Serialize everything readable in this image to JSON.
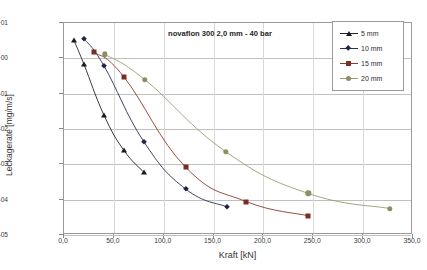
{
  "chart_data": {
    "type": "line",
    "title": "novaflon 300 2,0 mm  -  40 bar",
    "xlabel": "Kraft  [kN]",
    "ylabel": "Leckagerate [mg/m/s]",
    "xlim": [
      0,
      350
    ],
    "ylim": [
      1e-05,
      10
    ],
    "yscale": "log",
    "xscale": "linear",
    "grid": "horizontal-and-vertical",
    "legend_position": "top-right",
    "xticks": [
      0,
      50,
      100,
      150,
      200,
      250,
      300,
      350
    ],
    "xtick_labels": [
      "0,0",
      "50,0",
      "100,0",
      "150,0",
      "200,0",
      "250,0",
      "300,0",
      "350,0"
    ],
    "yticks": [
      10,
      1,
      0.1,
      0.01,
      0.001,
      0.0001,
      1e-05
    ],
    "ytick_labels": [
      "1,00E+01",
      "1,00E+00",
      "1,00E-01",
      "1,00E-02",
      "1,00E-03",
      "1,00E-04",
      "1,00E-05"
    ],
    "series": [
      {
        "name": "5 mm",
        "marker": "triangle",
        "color": "#1a1a1a",
        "line_color": "#232323",
        "x": [
          10,
          20,
          40,
          60,
          80
        ],
        "y": [
          3.2,
          0.68,
          0.025,
          0.0025,
          0.0006
        ]
      },
      {
        "name": "10 mm",
        "marker": "diamond",
        "color": "#1f2347",
        "line_color": "#2a2f55",
        "x": [
          20,
          40,
          80,
          122,
          163
        ],
        "y": [
          3.6,
          0.62,
          0.0044,
          0.0002,
          6.3e-05
        ]
      },
      {
        "name": "15 mm",
        "marker": "square",
        "color": "#7a2f24",
        "line_color": "#8a3a2c",
        "x": [
          30,
          60,
          122,
          183,
          245
        ],
        "y": [
          1.5,
          0.3,
          0.00083,
          8.8e-05,
          3.5e-05
        ]
      },
      {
        "name": "20 mm",
        "marker": "circle",
        "color": "#8d8f62",
        "line_color": "#9a9c72",
        "x": [
          41,
          81,
          162,
          245,
          327
        ],
        "y": [
          1.3,
          0.25,
          0.0023,
          0.00015,
          5.6e-05
        ]
      }
    ]
  },
  "legend": {
    "items": [
      {
        "label": "5 mm"
      },
      {
        "label": "10 mm"
      },
      {
        "label": "15 mm"
      },
      {
        "label": "20 mm"
      }
    ]
  }
}
